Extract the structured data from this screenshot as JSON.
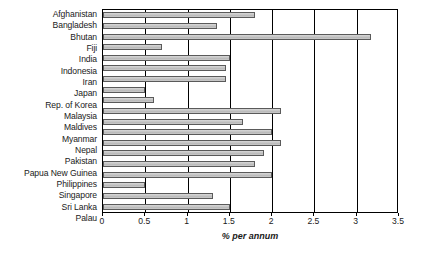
{
  "chart_data": {
    "type": "bar",
    "orientation": "horizontal",
    "title": "",
    "xlabel": "% per annum",
    "ylabel": "",
    "xlim": [
      0,
      3.5
    ],
    "xticks": [
      0,
      0.5,
      1,
      1.5,
      2,
      2.5,
      3,
      3.5
    ],
    "xtick_labels": [
      "0",
      "0.5",
      "1",
      "1.5",
      "2",
      "2.5",
      "3",
      "3.5"
    ],
    "grid": true,
    "legend": null,
    "categories": [
      "Afghanistan",
      "Bangladesh",
      "Bhutan",
      "Fiji",
      "India",
      "Indonesia",
      "Iran",
      "Japan",
      "Rep. of Korea",
      "Malaysia",
      "Maldives",
      "Myanmar",
      "Nepal",
      "Pakistan",
      "Papua New Guinea",
      "Philippines",
      "Singapore",
      "Sri Lanka",
      "Palau"
    ],
    "values": [
      1.8,
      1.35,
      3.17,
      0.7,
      1.5,
      1.45,
      1.45,
      0.5,
      0.6,
      2.1,
      1.65,
      2.0,
      2.1,
      1.9,
      1.8,
      2.0,
      0.5,
      1.3,
      1.5
    ],
    "bar_color": "#c6c6c6",
    "bar_edge_color": "#5a5a5a",
    "axis_color": "#000000"
  }
}
